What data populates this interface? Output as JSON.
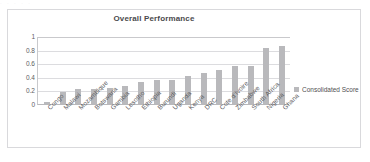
{
  "top_bleed_text": "·  ·    ·   ·        ·",
  "legend": {
    "label": "Consolidated Score",
    "swatch_color": "#b9b9bc",
    "position": "right"
  },
  "axis": {
    "y_ticks": [
      "1",
      "0.8",
      "0.6",
      "0.4",
      "0.2",
      "0"
    ]
  },
  "chart_data": {
    "type": "bar",
    "title": "Overall Performance",
    "xlabel": "",
    "ylabel": "",
    "ylim": [
      0,
      1
    ],
    "yticks": [
      0,
      0.2,
      0.4,
      0.6,
      0.8,
      1
    ],
    "grid": true,
    "legend_position": "right",
    "bar_color": "#b9b9bc",
    "categories": [
      "Congo",
      "Malawi",
      "Mozambique",
      "Botswana",
      "Gambia",
      "Lesotho",
      "Ethiopia",
      "Burundi",
      "Uganda",
      "Kenya",
      "DRC",
      "Cote d'Ivoire",
      "Zimbabwe",
      "South Africa",
      "Nigeria",
      "Ghana"
    ],
    "series": [
      {
        "name": "Consolidated Score",
        "values": [
          0.03,
          0.18,
          0.22,
          0.22,
          0.24,
          0.27,
          0.32,
          0.35,
          0.35,
          0.41,
          0.45,
          0.5,
          0.56,
          0.56,
          0.83,
          0.85
        ]
      }
    ]
  }
}
